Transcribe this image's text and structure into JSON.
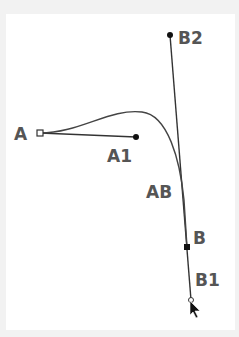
{
  "diagram": {
    "type": "cubic-bezier-handles",
    "colors": {
      "background": "#f2f2f2",
      "canvas": "#ffffff",
      "stroke": "#333333",
      "label": "#555555"
    },
    "points": {
      "A": {
        "label": "A",
        "x": 40,
        "y": 133,
        "marker": "hollow-square"
      },
      "A1": {
        "label": "A1",
        "x": 136,
        "y": 137,
        "marker": "dot"
      },
      "B2": {
        "label": "B2",
        "x": 170,
        "y": 35,
        "marker": "dot"
      },
      "B": {
        "label": "B",
        "x": 187,
        "y": 247,
        "marker": "filled-square"
      },
      "B1": {
        "label": "B1",
        "x": 191,
        "y": 300,
        "marker": "hollow-circle"
      },
      "AB": {
        "label": "AB",
        "x": 182,
        "y": 190,
        "marker": "none"
      }
    },
    "labels": {
      "A": "A",
      "A1": "A1",
      "B2": "B2",
      "B": "B",
      "B1": "B1",
      "AB": "AB"
    },
    "cursor": {
      "icon": "arrow-cursor-icon",
      "x": 190,
      "y": 300
    }
  }
}
